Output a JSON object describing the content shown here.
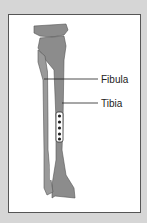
{
  "figure": {
    "title": "",
    "labels": [
      {
        "text": "Fibula"
      },
      {
        "text": "Tibia"
      }
    ],
    "colors": {
      "background": "#d6d6d6",
      "panel": "#ffffff",
      "bone": "#8c8c8c",
      "border": "#555555"
    }
  }
}
